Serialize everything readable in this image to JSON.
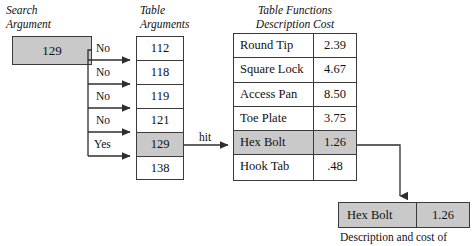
{
  "headers": {
    "search": "Search\nArgument",
    "table_arguments": "Table\nArguments",
    "table_functions": "Table Functions\nDescription Cost"
  },
  "search_box": {
    "value": "129"
  },
  "arg_table": {
    "rows": [
      {
        "value": "112",
        "highlighted": false
      },
      {
        "value": "118",
        "highlighted": false
      },
      {
        "value": "119",
        "highlighted": false
      },
      {
        "value": "121",
        "highlighted": false
      },
      {
        "value": "129",
        "highlighted": true
      },
      {
        "value": "138",
        "highlighted": false
      }
    ]
  },
  "fn_table": {
    "rows": [
      {
        "description": "Round Tip",
        "cost": "2.39",
        "highlighted": false
      },
      {
        "description": "Square Lock",
        "cost": "4.67",
        "highlighted": false
      },
      {
        "description": "Access Pan",
        "cost": "8.50",
        "highlighted": false
      },
      {
        "description": "Toe Plate",
        "cost": "3.75",
        "highlighted": false
      },
      {
        "description": "Hex Bolt",
        "cost": "1.26",
        "highlighted": true
      },
      {
        "description": "Hook Tab",
        "cost": ".48",
        "highlighted": false
      }
    ]
  },
  "edge_labels": {
    "compare": [
      "No",
      "No",
      "No",
      "No",
      "Yes"
    ],
    "hit": "hit"
  },
  "result_box": {
    "description": "Hex Bolt",
    "cost": "1.26"
  },
  "caption": "Description and cost of",
  "colors": {
    "highlight_fill": "#c9c9c9",
    "line": "#3a3a3a",
    "background": "#ffffff"
  }
}
